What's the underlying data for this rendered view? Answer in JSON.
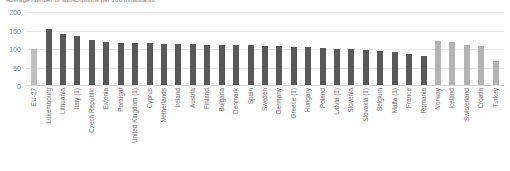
{
  "chart_data": {
    "type": "bar",
    "title": "Average number of subscriptions per 100 inhabitants",
    "xlabel": "",
    "ylabel": "",
    "ylim": [
      0,
      200
    ],
    "yticks": [
      "0",
      "50",
      "100",
      "150",
      "200"
    ],
    "ytick_values": [
      0,
      50,
      100,
      150,
      200
    ],
    "grid": true,
    "legend": "none",
    "colors": {
      "aggregate_bar": "#bfbfbf",
      "member_state_bar": "#595959",
      "non_member_bar": "#b3b3b3",
      "gridline": "#e8e8e8",
      "axis_text": "#808080",
      "label_text": "#6b6b6b"
    },
    "categories": [
      "EU-27",
      "Luxembourg",
      "Lithuania",
      "Italy (1)",
      "Czech Republic",
      "Estonia",
      "Portugal",
      "United Kingdom (1)",
      "Cyprus",
      "Netherlands",
      "Ireland",
      "Austria",
      "Finland",
      "Bulgaria",
      "Denmark",
      "Spain",
      "Sweden",
      "Germany",
      "Greece (1)",
      "Hungary",
      "Poland",
      "Latvia (1)",
      "Slovenia",
      "Slovakia (1)",
      "Belgium",
      "Malta (1)",
      "France",
      "Romania",
      "Norway",
      "Iceland",
      "Switzerland",
      "Croatia",
      "Turkey"
    ],
    "values": [
      100,
      155,
      141,
      135,
      125,
      118,
      117,
      116,
      115,
      114,
      113,
      113,
      112,
      112,
      111,
      110,
      108,
      107,
      106,
      105,
      103,
      101,
      99,
      97,
      95,
      92,
      86,
      82,
      122,
      120,
      110,
      108,
      67
    ],
    "series_groups": [
      "aggregate",
      "member",
      "member",
      "member",
      "member",
      "member",
      "member",
      "member",
      "member",
      "member",
      "member",
      "member",
      "member",
      "member",
      "member",
      "member",
      "member",
      "member",
      "member",
      "member",
      "member",
      "member",
      "member",
      "member",
      "member",
      "member",
      "member",
      "member",
      "non_member",
      "non_member",
      "non_member",
      "non_member",
      "non_member"
    ]
  }
}
